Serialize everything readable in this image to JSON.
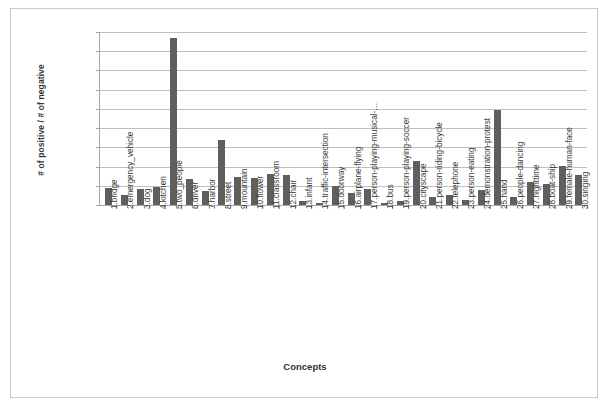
{
  "chart_data": {
    "type": "bar",
    "title": "",
    "xlabel": "Concepts",
    "ylabel": "# of positive / # of negative",
    "ylim": [
      0,
      0.45
    ],
    "ytick_step": 0.05,
    "grid": true,
    "legend": "none",
    "bar_color": "#5f5f5f",
    "categories": [
      "1.bridge",
      "2.emergency_vehicle",
      "3.dog",
      "4.kitchen",
      "5.two_people",
      "6.driver",
      "7.harbor",
      "8.street",
      "9.mountain",
      "10.flower",
      "11.classroom",
      "12.chair",
      "13.infant",
      "14.traffic-intersection",
      "15.doorway",
      "16.airplane-flying",
      "17.person-playing-musical-…",
      "18.bus",
      "19.person-playing-soccer",
      "20.cityscape",
      "21.person-riding-bicycle",
      "22.telephone",
      "23.person-eating",
      "24.demonstration-protest",
      "25.hand",
      "26.people-dancing",
      "27.nighttime",
      "28.boat-ship",
      "29.female-human-face",
      "30.singing"
    ],
    "values": [
      0.044,
      0.025,
      0.042,
      0.047,
      0.435,
      0.068,
      0.036,
      0.168,
      0.073,
      0.07,
      0.08,
      0.078,
      0.01,
      0.005,
      0.05,
      0.032,
      0.041,
      0.004,
      0.01,
      0.115,
      0.022,
      0.025,
      0.012,
      0.04,
      0.248,
      0.022,
      0.06,
      0.055,
      0.102,
      0.078
    ],
    "ytick_labels": [
      "0.00",
      "0.05",
      "0.10",
      "0.15",
      "0.20",
      "0.25",
      "0.30",
      "0.35",
      "0.40",
      "0.45"
    ]
  }
}
